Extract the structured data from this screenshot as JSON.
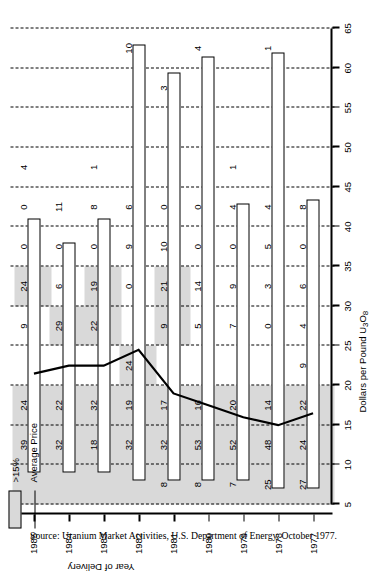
{
  "chart_data": {
    "type": "bar",
    "title": "",
    "xlabel": "Year of Delivery",
    "ylabel": "Dollars per Pound U3O8",
    "ylabel_html": "Dollars per Pound U₃O₈",
    "ylim": [
      5,
      65
    ],
    "yticks": [
      5,
      10,
      15,
      20,
      25,
      30,
      35,
      40,
      45,
      50,
      55,
      60,
      65
    ],
    "ytick_labels": [
      "5",
      "10",
      "15",
      "20",
      "25",
      "30",
      "35",
      "40",
      "45",
      "50",
      "55",
      "60",
      "65"
    ],
    "categories": [
      "1977",
      "1978",
      "1979",
      "1980",
      "1981",
      "1982",
      "1983",
      "1984",
      "1985"
    ],
    "grid": "dashed vertical gridlines every 5 dollars",
    "legend_position": "top-left",
    "legend": [
      {
        "label": ">15%",
        "style": "shaded-box",
        "color": "#d9d9d9"
      },
      {
        "label": "Average Price",
        "style": "line",
        "color": "#000000"
      }
    ],
    "bar_ranges": [
      {
        "year": "1977",
        "low": 7.0,
        "high": 43.5
      },
      {
        "year": "1978",
        "low": 7.0,
        "high": 62.0
      },
      {
        "year": "1979",
        "low": 8.0,
        "high": 43.0
      },
      {
        "year": "1980",
        "low": 8.0,
        "high": 61.5
      },
      {
        "year": "1981",
        "low": 8.0,
        "high": 59.5
      },
      {
        "year": "1982",
        "low": 8.0,
        "high": 63.0
      },
      {
        "year": "1983",
        "low": 9.0,
        "high": 41.0
      },
      {
        "year": "1984",
        "low": 9.0,
        "high": 38.0
      },
      {
        "year": "1985",
        "low": 9.0,
        "high": 41.0
      }
    ],
    "average_price": [
      {
        "year": "1977",
        "value": 16.5
      },
      {
        "year": "1978",
        "value": 15.0
      },
      {
        "year": "1979",
        "value": 16.0
      },
      {
        "year": "1980",
        "value": 17.5
      },
      {
        "year": "1981",
        "value": 19.0
      },
      {
        "year": "1982",
        "value": 24.5
      },
      {
        "year": "1983",
        "value": 22.5
      },
      {
        "year": "1984",
        "value": 22.5
      },
      {
        "year": "1985",
        "value": 21.5
      }
    ],
    "band_labels": [
      {
        "year": "1977",
        "cells": [
          {
            "band": "40-45",
            "value": "8"
          },
          {
            "band": "35-40",
            "value": "0"
          },
          {
            "band": "30-35",
            "value": "6"
          },
          {
            "band": "25-30",
            "value": "4"
          },
          {
            "band": "20-25",
            "value": "9"
          },
          {
            "band": "15-20",
            "value": "22"
          },
          {
            "band": "10-15",
            "value": "24"
          },
          {
            "band": "5-10",
            "value": "27"
          }
        ]
      },
      {
        "year": "1978",
        "cells": [
          {
            "band": "60-65",
            "value": "1"
          },
          {
            "band": "40-45",
            "value": "4"
          },
          {
            "band": "35-40",
            "value": "5"
          },
          {
            "band": "30-35",
            "value": "3"
          },
          {
            "band": "25-30",
            "value": "0"
          },
          {
            "band": "15-20",
            "value": "14"
          },
          {
            "band": "10-15",
            "value": "48"
          },
          {
            "band": "5-10",
            "value": "25"
          }
        ]
      },
      {
        "year": "1979",
        "cells": [
          {
            "band": "45-50",
            "value": "1"
          },
          {
            "band": "40-45",
            "value": "4"
          },
          {
            "band": "35-40",
            "value": "0"
          },
          {
            "band": "30-35",
            "value": "9"
          },
          {
            "band": "25-30",
            "value": "7"
          },
          {
            "band": "15-20",
            "value": "20"
          },
          {
            "band": "10-15",
            "value": "52"
          },
          {
            "band": "5-10",
            "value": "7"
          }
        ]
      },
      {
        "year": "1980",
        "cells": [
          {
            "band": "60-65",
            "value": "4"
          },
          {
            "band": "40-45",
            "value": "0"
          },
          {
            "band": "35-40",
            "value": "0"
          },
          {
            "band": "30-35",
            "value": "14"
          },
          {
            "band": "25-30",
            "value": "5"
          },
          {
            "band": "15-20",
            "value": "16"
          },
          {
            "band": "10-15",
            "value": "53"
          },
          {
            "band": "5-10",
            "value": "8"
          }
        ]
      },
      {
        "year": "1981",
        "cells": [
          {
            "band": "55-60",
            "value": "3"
          },
          {
            "band": "40-45",
            "value": "0"
          },
          {
            "band": "35-40",
            "value": "10"
          },
          {
            "band": "30-35",
            "value": "21"
          },
          {
            "band": "25-30",
            "value": "9"
          },
          {
            "band": "15-20",
            "value": "17"
          },
          {
            "band": "10-15",
            "value": "32"
          },
          {
            "band": "5-10",
            "value": "8"
          }
        ]
      },
      {
        "year": "1982",
        "cells": [
          {
            "band": "60-65",
            "value": "10"
          },
          {
            "band": "40-45",
            "value": "6"
          },
          {
            "band": "35-40",
            "value": "9"
          },
          {
            "band": "30-35",
            "value": "0"
          },
          {
            "band": "20-25",
            "value": "24"
          },
          {
            "band": "15-20",
            "value": "19"
          },
          {
            "band": "10-15",
            "value": "32"
          }
        ]
      },
      {
        "year": "1983",
        "cells": [
          {
            "band": "45-50",
            "value": "1"
          },
          {
            "band": "40-45",
            "value": "8"
          },
          {
            "band": "35-40",
            "value": "0"
          },
          {
            "band": "30-35",
            "value": "19"
          },
          {
            "band": "25-30",
            "value": "22"
          },
          {
            "band": "15-20",
            "value": "32"
          },
          {
            "band": "10-15",
            "value": "18"
          }
        ]
      },
      {
        "year": "1984",
        "cells": [
          {
            "band": "40-45",
            "value": "11"
          },
          {
            "band": "35-40",
            "value": "0"
          },
          {
            "band": "30-35",
            "value": "6"
          },
          {
            "band": "25-30",
            "value": "29"
          },
          {
            "band": "15-20",
            "value": "22"
          },
          {
            "band": "10-15",
            "value": "32"
          }
        ]
      },
      {
        "year": "1985",
        "cells": [
          {
            "band": "45-50",
            "value": "4"
          },
          {
            "band": "40-45",
            "value": "0"
          },
          {
            "band": "35-40",
            "value": "0"
          },
          {
            "band": "30-35",
            "value": "24"
          },
          {
            "band": "25-30",
            "value": "9"
          },
          {
            "band": "15-20",
            "value": "24"
          },
          {
            "band": "10-15",
            "value": "39"
          }
        ]
      }
    ]
  },
  "source_note": "Source: Uranium Market Activities, U.S. Department of Energy, October 1977."
}
